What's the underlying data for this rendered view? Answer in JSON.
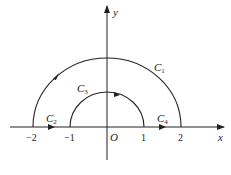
{
  "diagram": {
    "type": "contour-plot",
    "axes": {
      "x_label": "x",
      "y_label": "y",
      "origin_label": "O",
      "x_ticks": [
        {
          "value": -2,
          "label": "−2"
        },
        {
          "value": -1,
          "label": "−1"
        },
        {
          "value": 1,
          "label": "1"
        },
        {
          "value": 2,
          "label": "2"
        }
      ]
    },
    "curves": [
      {
        "id": "C1",
        "name": "C",
        "sub": "1",
        "description": "upper semicircle radius 2, counterclockwise (from 2 to -2)"
      },
      {
        "id": "C2",
        "name": "C",
        "sub": "2",
        "description": "segment on x-axis from -2 to -1, rightward"
      },
      {
        "id": "C3",
        "name": "C",
        "sub": "3",
        "description": "upper semicircle radius 1, clockwise (from -1 to 1)"
      },
      {
        "id": "C4",
        "name": "C",
        "sub": "4",
        "description": "segment on x-axis from 1 to 2, rightward"
      }
    ],
    "colors": {
      "stroke": "#222222",
      "background": "#ffffff"
    }
  }
}
